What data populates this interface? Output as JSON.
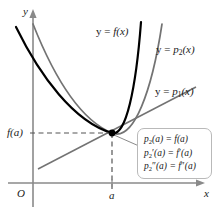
{
  "figure": {
    "axes": {
      "x_label": "x",
      "y_label": "y",
      "origin_label": "O",
      "x_tick_label": "a",
      "y_tick_label": "f(a)"
    },
    "curve_labels": {
      "f": {
        "prefix": "y = ",
        "name": "f",
        "arg": "(x)"
      },
      "p2": {
        "prefix": "y = ",
        "name": "p",
        "sub": "2",
        "arg": "(x)"
      },
      "p1": {
        "prefix": "y = ",
        "name": "p",
        "sub": "1",
        "arg": "(x)"
      }
    },
    "callout": {
      "lines": [
        {
          "lhs_name": "p",
          "lhs_sub": "2",
          "lhs_primes": "",
          "lhs_arg": "(a)",
          "eq": " = ",
          "rhs_name": "f",
          "rhs_primes": "",
          "rhs_arg": "(a)"
        },
        {
          "lhs_name": "p",
          "lhs_sub": "2",
          "lhs_primes": "′",
          "lhs_arg": "(a)",
          "eq": " = ",
          "rhs_name": "f",
          "rhs_primes": "′",
          "rhs_arg": "(a)"
        },
        {
          "lhs_name": "p",
          "lhs_sub": "2",
          "lhs_primes": "″",
          "lhs_arg": "(a)",
          "eq": " = ",
          "rhs_name": "f",
          "rhs_primes": "″",
          "rhs_arg": "(a)"
        }
      ]
    },
    "colors": {
      "f_curve": "#000000",
      "p2_curve": "#737373",
      "p1_line": "#737373",
      "axis": "#8a8a8a",
      "dashed": "#555555",
      "callout_border": "#b9b9b9",
      "point": "#000000",
      "background": "#ffffff"
    },
    "point_of_tangency": {
      "x_label": "a",
      "y_label": "f(a)",
      "x_px": 112,
      "y_px": 133
    }
  }
}
